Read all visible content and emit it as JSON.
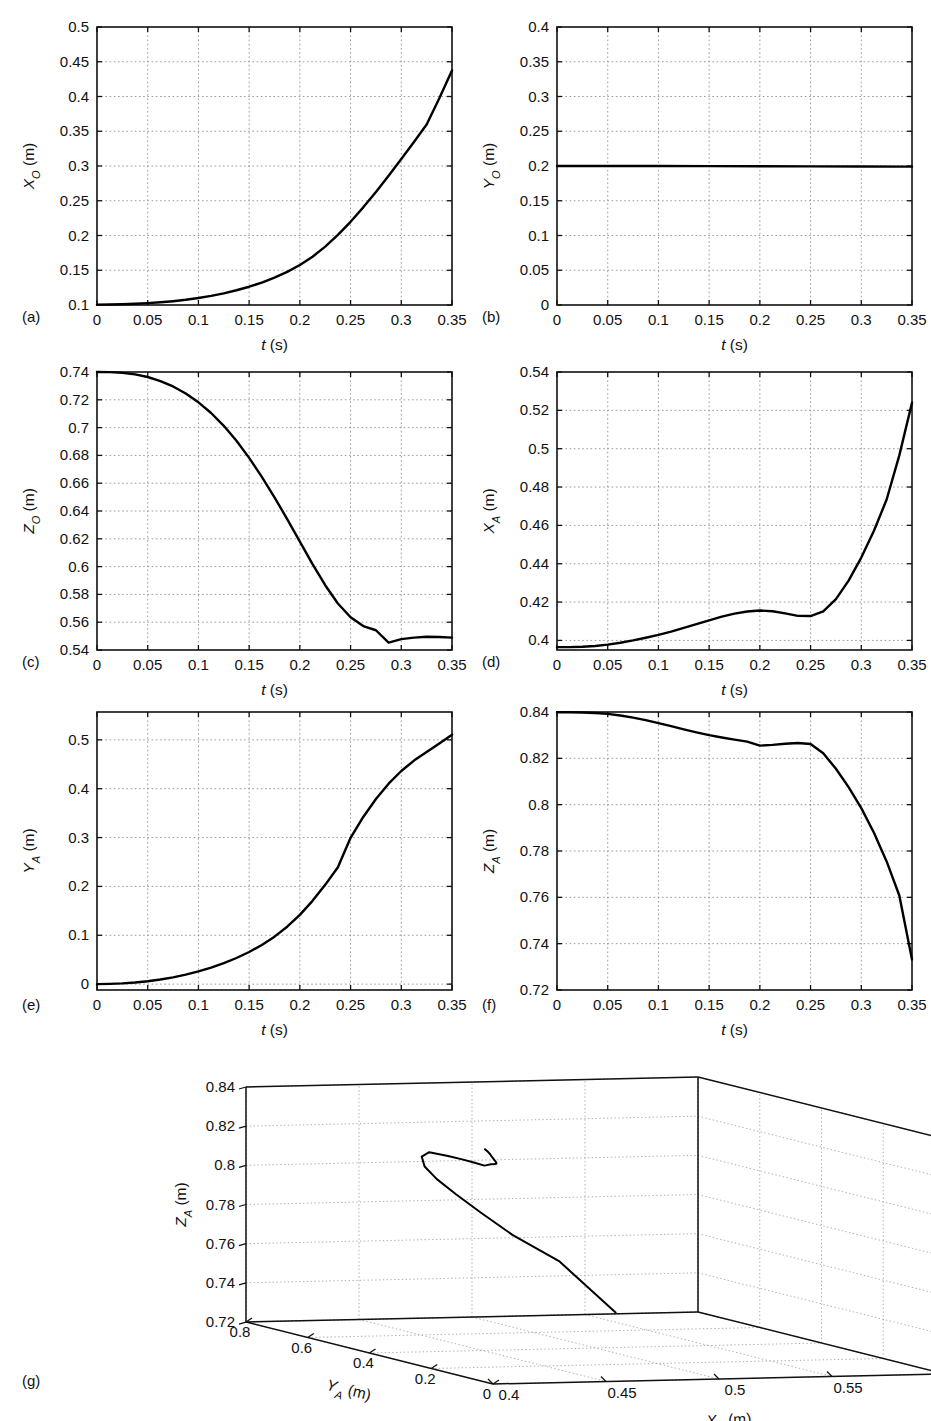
{
  "figure": {
    "panel_captions": [
      "(a)",
      "(b)",
      "(c)",
      "(d)",
      "(e)",
      "(f)",
      "(g)"
    ],
    "xlabel_common": "t (s)",
    "units": "(m)"
  },
  "chart_data": [
    {
      "id": "a",
      "caption": "(a)",
      "type": "line",
      "title": "",
      "xlabel": "t (s)",
      "ylabel": "X_O (m)",
      "ylabel_symbol": "X",
      "ylabel_sub": "O",
      "xlim": [
        0,
        0.35
      ],
      "ylim": [
        0.1,
        0.5
      ],
      "xticks": [
        0,
        0.05,
        0.1,
        0.15,
        0.2,
        0.25,
        0.3,
        0.35
      ],
      "xticklabels": [
        "0",
        "0.05",
        "0.1",
        "0.15",
        "0.2",
        "0.25",
        "0.3",
        "0.35"
      ],
      "yticks": [
        0.1,
        0.15,
        0.2,
        0.25,
        0.3,
        0.35,
        0.4,
        0.45,
        0.5
      ],
      "yticklabels": [
        "0.1",
        "0.15",
        "0.2",
        "0.25",
        "0.3",
        "0.35",
        "0.4",
        "0.45",
        "0.5"
      ],
      "grid": true,
      "legend": null,
      "x": [
        0,
        0.0125,
        0.025,
        0.0375,
        0.05,
        0.0625,
        0.075,
        0.0875,
        0.1,
        0.1125,
        0.125,
        0.1375,
        0.15,
        0.1625,
        0.175,
        0.1875,
        0.2,
        0.2125,
        0.225,
        0.2375,
        0.25,
        0.2625,
        0.275,
        0.2875,
        0.3,
        0.3125,
        0.325,
        0.3375,
        0.35
      ],
      "y": [
        0.1005,
        0.1007,
        0.1011,
        0.1018,
        0.1027,
        0.1039,
        0.1055,
        0.1075,
        0.11,
        0.1131,
        0.1168,
        0.1212,
        0.1263,
        0.1323,
        0.1393,
        0.1476,
        0.1575,
        0.1695,
        0.184,
        0.2008,
        0.2197,
        0.2405,
        0.2627,
        0.286,
        0.31,
        0.3345,
        0.3598,
        0.3975,
        0.4375
      ]
    },
    {
      "id": "b",
      "caption": "(b)",
      "type": "line",
      "title": "",
      "xlabel": "t (s)",
      "ylabel": "Y_O (m)",
      "ylabel_symbol": "Y",
      "ylabel_sub": "O",
      "xlim": [
        0,
        0.35
      ],
      "ylim": [
        0,
        0.4
      ],
      "xticks": [
        0,
        0.05,
        0.1,
        0.15,
        0.2,
        0.25,
        0.3,
        0.35
      ],
      "xticklabels": [
        "0",
        "0.05",
        "0.1",
        "0.15",
        "0.2",
        "0.25",
        "0.3",
        "0.35"
      ],
      "yticks": [
        0,
        0.05,
        0.1,
        0.15,
        0.2,
        0.25,
        0.3,
        0.35,
        0.4
      ],
      "yticklabels": [
        "0",
        "0.05",
        "0.1",
        "0.15",
        "0.2",
        "0.25",
        "0.3",
        "0.35",
        "0.4"
      ],
      "grid": true,
      "legend": null,
      "x": [
        0,
        0.05,
        0.1,
        0.15,
        0.2,
        0.25,
        0.3,
        0.35
      ],
      "y": [
        0.2,
        0.2,
        0.1999,
        0.1998,
        0.1997,
        0.1995,
        0.1993,
        0.1991
      ]
    },
    {
      "id": "c",
      "caption": "(c)",
      "type": "line",
      "title": "",
      "xlabel": "t (s)",
      "ylabel": "Z_O (m)",
      "ylabel_symbol": "Z",
      "ylabel_sub": "O",
      "xlim": [
        0,
        0.35
      ],
      "ylim": [
        0.54,
        0.74
      ],
      "xticks": [
        0,
        0.05,
        0.1,
        0.15,
        0.2,
        0.25,
        0.3,
        0.35
      ],
      "xticklabels": [
        "0",
        "0.05",
        "0.1",
        "0.15",
        "0.2",
        "0.25",
        "0.3",
        "0.35"
      ],
      "yticks": [
        0.54,
        0.56,
        0.58,
        0.6,
        0.62,
        0.64,
        0.66,
        0.68,
        0.7,
        0.72,
        0.74
      ],
      "yticklabels": [
        "0.54",
        "0.56",
        "0.58",
        "0.6",
        "0.62",
        "0.64",
        "0.66",
        "0.68",
        "0.7",
        "0.72",
        "0.74"
      ],
      "grid": true,
      "legend": null,
      "x": [
        0,
        0.0125,
        0.025,
        0.0375,
        0.05,
        0.0625,
        0.075,
        0.0875,
        0.1,
        0.1125,
        0.125,
        0.1375,
        0.15,
        0.1625,
        0.175,
        0.1875,
        0.2,
        0.2125,
        0.225,
        0.2375,
        0.25,
        0.2625,
        0.275,
        0.2875,
        0.3,
        0.3125,
        0.325,
        0.3375,
        0.35
      ],
      "y": [
        0.74,
        0.7399,
        0.7394,
        0.7383,
        0.7364,
        0.7335,
        0.7296,
        0.7245,
        0.7182,
        0.7105,
        0.7013,
        0.6905,
        0.6782,
        0.6645,
        0.6498,
        0.6342,
        0.618,
        0.6018,
        0.5866,
        0.5735,
        0.5636,
        0.5572,
        0.5542,
        0.5453,
        0.5478,
        0.5489,
        0.5495,
        0.5494,
        0.5489
      ]
    },
    {
      "id": "d",
      "caption": "(d)",
      "type": "line",
      "title": "",
      "xlabel": "t (s)",
      "ylabel": "X_A (m)",
      "ylabel_symbol": "X",
      "ylabel_sub": "A",
      "xlim": [
        0,
        0.35
      ],
      "ylim": [
        0.395,
        0.54
      ],
      "xticks": [
        0,
        0.05,
        0.1,
        0.15,
        0.2,
        0.25,
        0.3,
        0.35
      ],
      "xticklabels": [
        "0",
        "0.05",
        "0.1",
        "0.15",
        "0.2",
        "0.25",
        "0.3",
        "0.35"
      ],
      "yticks": [
        0.4,
        0.42,
        0.44,
        0.46,
        0.48,
        0.5,
        0.52,
        0.54
      ],
      "yticklabels": [
        "0.4",
        "0.42",
        "0.44",
        "0.46",
        "0.48",
        "0.5",
        "0.52",
        "0.54"
      ],
      "grid": true,
      "legend": null,
      "x": [
        0,
        0.0125,
        0.025,
        0.0375,
        0.05,
        0.0625,
        0.075,
        0.0875,
        0.1,
        0.1125,
        0.125,
        0.1375,
        0.15,
        0.1625,
        0.175,
        0.1875,
        0.2,
        0.2125,
        0.225,
        0.2375,
        0.25,
        0.2625,
        0.275,
        0.2875,
        0.3,
        0.3125,
        0.325,
        0.3375,
        0.35
      ],
      "y": [
        0.3965,
        0.3965,
        0.3967,
        0.3971,
        0.3978,
        0.3988,
        0.4,
        0.4014,
        0.4029,
        0.4046,
        0.4065,
        0.4085,
        0.4105,
        0.4124,
        0.414,
        0.4151,
        0.4156,
        0.4152,
        0.4141,
        0.4128,
        0.4127,
        0.4152,
        0.4215,
        0.4312,
        0.4432,
        0.4572,
        0.4735,
        0.4965,
        0.524
      ]
    },
    {
      "id": "e",
      "caption": "(e)",
      "type": "line",
      "title": "",
      "xlabel": "t (s)",
      "ylabel": "Y_A (m)",
      "ylabel_symbol": "Y",
      "ylabel_sub": "A",
      "xlim": [
        0,
        0.35
      ],
      "ylim": [
        -0.012,
        0.557
      ],
      "xticks": [
        0,
        0.05,
        0.1,
        0.15,
        0.2,
        0.25,
        0.3,
        0.35
      ],
      "xticklabels": [
        "0",
        "0.05",
        "0.1",
        "0.15",
        "0.2",
        "0.25",
        "0.3",
        "0.35"
      ],
      "yticks": [
        0,
        0.1,
        0.2,
        0.3,
        0.4,
        0.5
      ],
      "yticklabels": [
        "0",
        "0.1",
        "0.2",
        "0.3",
        "0.4",
        "0.5"
      ],
      "grid": true,
      "legend": null,
      "x": [
        0,
        0.0125,
        0.025,
        0.0375,
        0.05,
        0.0625,
        0.075,
        0.0875,
        0.1,
        0.1125,
        0.125,
        0.1375,
        0.15,
        0.1625,
        0.175,
        0.1875,
        0.2,
        0.2125,
        0.225,
        0.2375,
        0.25,
        0.2625,
        0.275,
        0.2875,
        0.3,
        0.3125,
        0.325,
        0.3375,
        0.35
      ],
      "y": [
        0.0,
        0.0005,
        0.0016,
        0.0034,
        0.006,
        0.0095,
        0.0139,
        0.0194,
        0.026,
        0.0338,
        0.0429,
        0.0535,
        0.0658,
        0.0802,
        0.0972,
        0.1175,
        0.1418,
        0.1705,
        0.2032,
        0.2392,
        0.2995,
        0.3422,
        0.3789,
        0.4102,
        0.4362,
        0.4575,
        0.4752,
        0.4925,
        0.5105
      ]
    },
    {
      "id": "f",
      "caption": "(f)",
      "type": "line",
      "title": "",
      "xlabel": "t (s)",
      "ylabel": "Z_A (m)",
      "ylabel_symbol": "Z",
      "ylabel_sub": "A",
      "xlim": [
        0,
        0.35
      ],
      "ylim": [
        0.72,
        0.84
      ],
      "xticks": [
        0,
        0.05,
        0.1,
        0.15,
        0.2,
        0.25,
        0.3,
        0.35
      ],
      "xticklabels": [
        "0",
        "0.05",
        "0.1",
        "0.15",
        "0.2",
        "0.25",
        "0.3",
        "0.35"
      ],
      "yticks": [
        0.72,
        0.74,
        0.76,
        0.78,
        0.8,
        0.82,
        0.84
      ],
      "yticklabels": [
        "0.72",
        "0.74",
        "0.76",
        "0.78",
        "0.8",
        "0.82",
        "0.84"
      ],
      "grid": true,
      "legend": null,
      "x": [
        0,
        0.0125,
        0.025,
        0.0375,
        0.05,
        0.0625,
        0.075,
        0.0875,
        0.1,
        0.1125,
        0.125,
        0.1375,
        0.15,
        0.1625,
        0.175,
        0.1875,
        0.2,
        0.2125,
        0.225,
        0.2375,
        0.25,
        0.2625,
        0.275,
        0.2875,
        0.3,
        0.3125,
        0.325,
        0.3375,
        0.35
      ],
      "y": [
        0.8399,
        0.8399,
        0.8398,
        0.8396,
        0.8392,
        0.8385,
        0.8376,
        0.8365,
        0.8352,
        0.8339,
        0.8325,
        0.8312,
        0.83,
        0.829,
        0.8281,
        0.8272,
        0.8255,
        0.8258,
        0.8263,
        0.8266,
        0.8262,
        0.8222,
        0.8155,
        0.8076,
        0.7985,
        0.7879,
        0.7755,
        0.7608,
        0.7332
      ]
    },
    {
      "id": "g",
      "caption": "(g)",
      "type": "line3d",
      "title": "",
      "xlabel": "X_A (m)",
      "ylabel": "Y_A (m)",
      "zlabel": "Z_A (m)",
      "xlabel_symbol": "X",
      "xlabel_sub": "A",
      "ylabel_symbol": "Y",
      "ylabel_sub": "A",
      "zlabel_symbol": "Z",
      "zlabel_sub": "A",
      "xlim": [
        0.4,
        0.6
      ],
      "ylim": [
        0,
        0.8
      ],
      "zlim": [
        0.72,
        0.84
      ],
      "xticks": [
        0.4,
        0.45,
        0.5,
        0.55,
        0.6
      ],
      "xticklabels": [
        "0.4",
        "0.45",
        "0.5",
        "0.55",
        "0.6"
      ],
      "yticks": [
        0,
        0.2,
        0.4,
        0.6,
        0.8
      ],
      "yticklabels": [
        "0",
        "0.2",
        "0.4",
        "0.6",
        "0.8"
      ],
      "zticks": [
        0.72,
        0.74,
        0.76,
        0.78,
        0.8,
        0.82,
        0.84
      ],
      "zticklabels": [
        "0.72",
        "0.74",
        "0.76",
        "0.78",
        "0.8",
        "0.82",
        "0.84"
      ],
      "grid": true,
      "legend": null,
      "x": [
        0.3965,
        0.3965,
        0.3967,
        0.3971,
        0.3978,
        0.3988,
        0.4,
        0.4014,
        0.4029,
        0.4046,
        0.4065,
        0.4085,
        0.4105,
        0.4124,
        0.414,
        0.4151,
        0.4156,
        0.4152,
        0.4141,
        0.4128,
        0.4127,
        0.4152,
        0.4215,
        0.4312,
        0.4432,
        0.4572,
        0.4735,
        0.4965,
        0.524
      ],
      "y": [
        0.0,
        0.0005,
        0.0016,
        0.0034,
        0.006,
        0.0095,
        0.0139,
        0.0194,
        0.026,
        0.0338,
        0.0429,
        0.0535,
        0.0658,
        0.0802,
        0.0972,
        0.1175,
        0.1418,
        0.1705,
        0.2032,
        0.2392,
        0.2995,
        0.3422,
        0.3789,
        0.4102,
        0.4362,
        0.4575,
        0.4752,
        0.4925,
        0.5105
      ],
      "z": [
        0.8399,
        0.8399,
        0.8398,
        0.8396,
        0.8392,
        0.8385,
        0.8376,
        0.8365,
        0.8352,
        0.8339,
        0.8325,
        0.8312,
        0.83,
        0.829,
        0.8281,
        0.8272,
        0.8255,
        0.8258,
        0.8263,
        0.8266,
        0.8262,
        0.8222,
        0.8155,
        0.8076,
        0.7985,
        0.7879,
        0.7755,
        0.7608,
        0.7332
      ]
    }
  ]
}
